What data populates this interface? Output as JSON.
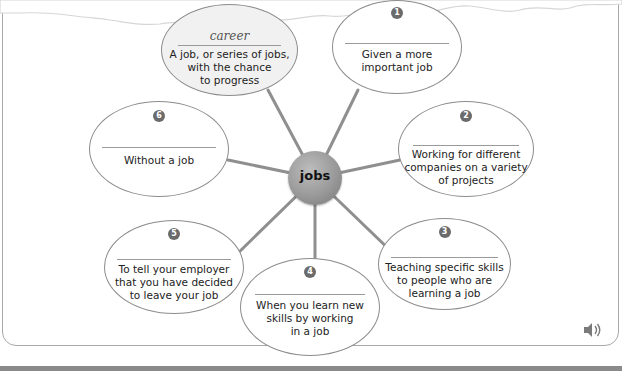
{
  "diagram": {
    "hub_label": "jobs",
    "example": {
      "word": "career",
      "definition_lines": [
        "A job, or series of jobs,",
        "with the chance",
        "to progress"
      ]
    },
    "items": [
      {
        "number": "1",
        "word": "",
        "definition_lines": [
          "Given a more",
          "important job"
        ]
      },
      {
        "number": "2",
        "word": "",
        "definition_lines": [
          "Working for different",
          "companies on a variety",
          "of projects"
        ]
      },
      {
        "number": "3",
        "word": "",
        "definition_lines": [
          "Teaching specific skills",
          "to people who are",
          "learning a job"
        ]
      },
      {
        "number": "4",
        "word": "",
        "definition_lines": [
          "When you learn new",
          "skills by working",
          "in a job"
        ]
      },
      {
        "number": "5",
        "word": "",
        "definition_lines": [
          "To tell your employer",
          "that you have decided",
          "to leave your job"
        ]
      },
      {
        "number": "6",
        "word": "",
        "definition_lines": [
          "Without a job"
        ]
      }
    ]
  },
  "controls": {
    "audio_icon": "speaker-icon"
  }
}
